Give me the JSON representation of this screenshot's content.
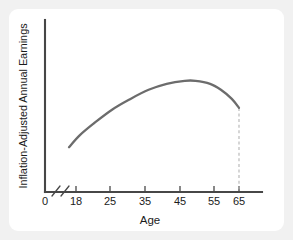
{
  "card": {
    "background_color": "#ffffff",
    "page_background_color": "#f1f1f1"
  },
  "chart_data": {
    "type": "line",
    "title": "",
    "subtitle": "",
    "xlabel": "Age",
    "ylabel": "Inflation-Adjusted Annual Earnings",
    "xlim": [
      18,
      70
    ],
    "ylim": [
      0,
      100
    ],
    "x_tick_labels": [
      "0",
      "18",
      "25",
      "35",
      "45",
      "55",
      "65"
    ],
    "y_tick_labels": [],
    "grid": false,
    "legend": null,
    "legend_position": "none",
    "axis_break": {
      "present": true,
      "between": [
        "0",
        "18"
      ],
      "style": "double-slash"
    },
    "series": [
      {
        "name": "Age-earnings profile",
        "line_color": "#6c6c6c",
        "line_width": 2.3,
        "x": [
          18,
          21,
          25,
          30,
          35,
          40,
          45,
          50,
          53,
          57,
          60,
          63,
          65
        ],
        "values": [
          29,
          37,
          45,
          54,
          61,
          67,
          71,
          73,
          73,
          71,
          67,
          61,
          55
        ]
      }
    ],
    "annotations": [
      {
        "name": "retirement-drop-line",
        "type": "vertical-dashed-line",
        "x": 65,
        "from_value": 55,
        "to_value": 0,
        "color": "#b4b4b4"
      }
    ]
  }
}
